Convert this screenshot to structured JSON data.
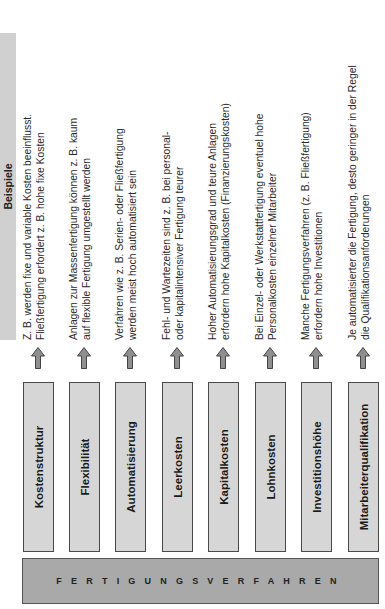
{
  "header": {
    "title": "Beispiele"
  },
  "base": {
    "label": "FERTIGUNGSVERFAHREN"
  },
  "colors": {
    "factor_box": "#d6d6d6",
    "base_bar": "#a9a9a9",
    "header_bar": "#d0d0d0",
    "arrow": "#8f8f8f",
    "border": "#4a4a4a"
  },
  "rows": [
    {
      "factor": "Kostenstruktur",
      "example_line1": "Z. B. werden fixe und variable Kosten beeinflusst.",
      "example_line2": "Fließfertigung erfordert z. B. hohe fixe Kosten"
    },
    {
      "factor": "Flexibilität",
      "example_line1": "Anlagen zur Massenfertigung können z. B. kaum",
      "example_line2": "auf flexible Fertigung umgestellt werden"
    },
    {
      "factor": "Automatisierung",
      "example_line1": "Verfahren wie z. B. Serien- oder Fließfertigung",
      "example_line2": "werden meist hoch automatisiert sein"
    },
    {
      "factor": "Leerkosten",
      "example_line1": "Fehl- und Wartezeiten sind z. B. bei personal-",
      "example_line2": "oder kapitalintensiver Fertigung teurer"
    },
    {
      "factor": "Kapitalkosten",
      "example_line1": "Hoher Automatisierungsgrad und teure Anlagen",
      "example_line2": "erfordern hohe Kapitalkosten (Finanzierungskosten)"
    },
    {
      "factor": "Lohnkosten",
      "example_line1": "Bei Einzel- oder Werkstattfertigung eventuel hohe",
      "example_line2": "Personalkosten einzelner Mitarbeiter"
    },
    {
      "factor": "Investitionshöhe",
      "example_line1": "Manche Fertigungsverfahren (z. B. Fließfertigung)",
      "example_line2": "erfordern hohe Investitionen"
    },
    {
      "factor": "Mitarbeiterqualifikation",
      "example_line1": "Je automatisierter die Fertigung, desto geringer in der Regel",
      "example_line2": "die Qualifikationsanforderungen"
    }
  ]
}
